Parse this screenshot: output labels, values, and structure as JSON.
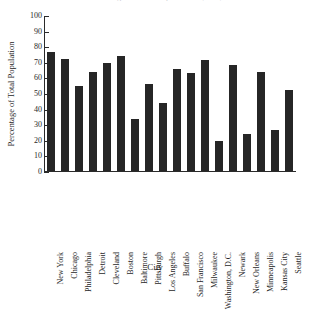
{
  "chart_data": {
    "type": "bar",
    "title": "Percentage of Total Population by City",
    "xlabel": "City",
    "ylabel": "Percentage of Total Population",
    "ylim": [
      0,
      100
    ],
    "ytick_step": 10,
    "yticks": [
      100,
      90,
      80,
      70,
      60,
      50,
      40,
      30,
      20,
      10,
      0
    ],
    "grid": false,
    "legend": false,
    "bar_color": "#262626",
    "axis_color": "#2b2b2b",
    "categories": [
      "New York",
      "Chicago",
      "Philadelphia",
      "Detroit",
      "Cleveland",
      "Boston",
      "Baltimore",
      "Pittsburgh",
      "Los Angeles",
      "Buffalo",
      "San Francisco",
      "Milwaukee",
      "Washington, D.C.",
      "Newark",
      "New Orleans",
      "Minneapolis",
      "Kansas City",
      "Seattle"
    ],
    "values": [
      76,
      72,
      54.5,
      63.5,
      69,
      73.5,
      33.5,
      56,
      43.5,
      65.5,
      63,
      71,
      19.5,
      68,
      24,
      63.5,
      26,
      52
    ]
  }
}
